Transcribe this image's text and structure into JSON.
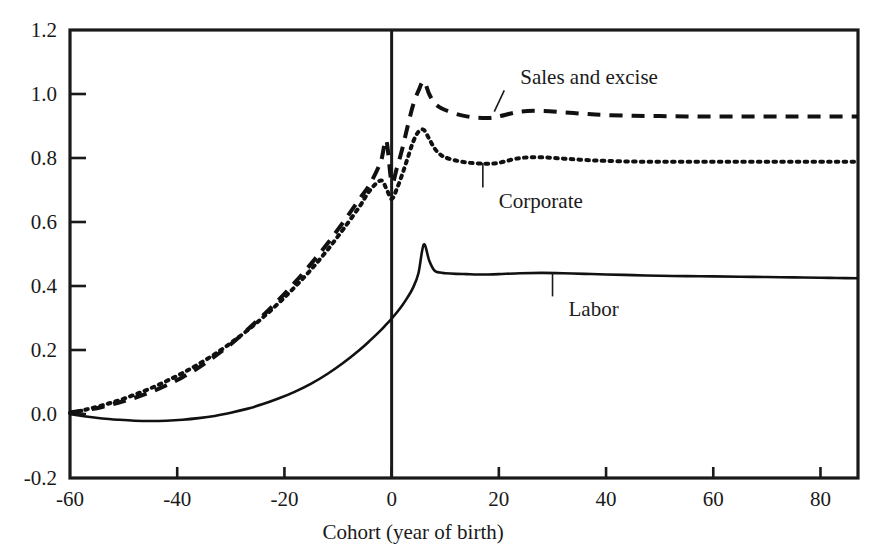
{
  "chart_data": {
    "type": "line",
    "title": "",
    "xlabel": "Cohort   (year of birth)",
    "ylabel": "",
    "xlim": [
      -60,
      87
    ],
    "ylim": [
      -0.2,
      1.2
    ],
    "grid": false,
    "legend_position": "inline-annotations",
    "xticks": [
      -60,
      -40,
      -20,
      0,
      20,
      40,
      60,
      80
    ],
    "xtick_labels": [
      "-60",
      "-40",
      "-20",
      "0",
      "20",
      "40",
      "60",
      "80"
    ],
    "yticks": [
      -0.2,
      0.0,
      0.2,
      0.4,
      0.6,
      0.8,
      1.0,
      1.2
    ],
    "ytick_labels": [
      "-0.2",
      "0.0",
      "0.2",
      "0.4",
      "0.6",
      "0.8",
      "1.0",
      "1.2"
    ],
    "reference_line_x": 0,
    "series": [
      {
        "name": "Sales and excise",
        "style": "dashed",
        "color": "#111111",
        "x": [
          -60,
          -57,
          -54,
          -51,
          -48,
          -45,
          -42,
          -39,
          -36,
          -33,
          -30,
          -27,
          -24,
          -21,
          -18,
          -15,
          -12,
          -9,
          -6,
          -4,
          -2,
          -1,
          0,
          1,
          2,
          3,
          4,
          5,
          6,
          7,
          8,
          9,
          10,
          12,
          14,
          16,
          18,
          20,
          24,
          28,
          32,
          36,
          40,
          45,
          50,
          55,
          60,
          65,
          70,
          75,
          80,
          83,
          87
        ],
        "values": [
          0.005,
          0.012,
          0.022,
          0.035,
          0.05,
          0.068,
          0.09,
          0.115,
          0.145,
          0.18,
          0.218,
          0.262,
          0.308,
          0.358,
          0.412,
          0.47,
          0.532,
          0.6,
          0.672,
          0.72,
          0.79,
          0.855,
          0.725,
          0.77,
          0.83,
          0.9,
          0.965,
          1.01,
          1.04,
          1.0,
          0.972,
          0.958,
          0.95,
          0.938,
          0.93,
          0.926,
          0.925,
          0.93,
          0.945,
          0.947,
          0.943,
          0.938,
          0.934,
          0.932,
          0.931,
          0.93,
          0.93,
          0.93,
          0.93,
          0.93,
          0.93,
          0.93,
          0.93
        ]
      },
      {
        "name": "Corporate",
        "style": "dotted",
        "color": "#111111",
        "x": [
          -60,
          -57,
          -54,
          -51,
          -48,
          -45,
          -42,
          -39,
          -36,
          -33,
          -30,
          -27,
          -24,
          -21,
          -18,
          -15,
          -12,
          -9,
          -6,
          -4,
          -2,
          -1,
          0,
          1,
          2,
          3,
          4,
          5,
          6,
          7,
          8,
          9,
          10,
          12,
          14,
          16,
          18,
          20,
          24,
          28,
          32,
          36,
          40,
          45,
          50,
          55,
          60,
          65,
          70,
          75,
          80,
          83,
          87
        ],
        "values": [
          0.003,
          0.014,
          0.027,
          0.042,
          0.06,
          0.08,
          0.103,
          0.128,
          0.156,
          0.187,
          0.222,
          0.26,
          0.302,
          0.348,
          0.398,
          0.452,
          0.512,
          0.578,
          0.648,
          0.7,
          0.73,
          0.705,
          0.672,
          0.705,
          0.75,
          0.8,
          0.85,
          0.882,
          0.888,
          0.86,
          0.83,
          0.812,
          0.802,
          0.792,
          0.786,
          0.783,
          0.782,
          0.785,
          0.8,
          0.802,
          0.798,
          0.794,
          0.791,
          0.789,
          0.788,
          0.788,
          0.788,
          0.788,
          0.788,
          0.788,
          0.788,
          0.788,
          0.788
        ]
      },
      {
        "name": "Labor",
        "style": "solid",
        "color": "#111111",
        "x": [
          -60,
          -57,
          -54,
          -51,
          -48,
          -45,
          -42,
          -39,
          -36,
          -33,
          -30,
          -27,
          -24,
          -21,
          -18,
          -15,
          -12,
          -9,
          -6,
          -4,
          -2,
          -1,
          0,
          1,
          2,
          3,
          4,
          5,
          6,
          7,
          8,
          9,
          10,
          12,
          14,
          16,
          18,
          20,
          24,
          28,
          32,
          36,
          40,
          45,
          50,
          55,
          60,
          65,
          70,
          75,
          80,
          83,
          87
        ],
        "values": [
          0.0,
          -0.008,
          -0.014,
          -0.018,
          -0.021,
          -0.022,
          -0.021,
          -0.018,
          -0.013,
          -0.006,
          0.004,
          0.016,
          0.031,
          0.049,
          0.07,
          0.095,
          0.125,
          0.16,
          0.2,
          0.23,
          0.262,
          0.28,
          0.298,
          0.318,
          0.34,
          0.365,
          0.395,
          0.44,
          0.53,
          0.48,
          0.448,
          0.442,
          0.44,
          0.438,
          0.437,
          0.436,
          0.436,
          0.437,
          0.44,
          0.441,
          0.44,
          0.438,
          0.436,
          0.434,
          0.432,
          0.431,
          0.43,
          0.429,
          0.428,
          0.427,
          0.426,
          0.425,
          0.424
        ]
      }
    ],
    "annotations": [
      {
        "text": "Sales and excise",
        "target_series": "Sales and excise",
        "text_x": 24,
        "text_y": 1.03
      },
      {
        "text": "Corporate",
        "target_series": "Corporate",
        "text_x": 20,
        "text_y": 0.645
      },
      {
        "text": "Labor",
        "target_series": "Labor",
        "text_x": 33,
        "text_y": 0.305
      }
    ]
  }
}
